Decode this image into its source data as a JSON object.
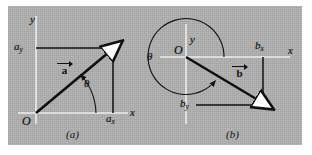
{
  "figure": {
    "background_color": "#a9a9a9",
    "border_color": "#ffffff",
    "ink_color": "#101010",
    "axis_color": "#e8e8e8",
    "arrowhead_fill": "#ffffff"
  },
  "panels": [
    {
      "id": "a",
      "caption": "(a)",
      "origin_label": "O",
      "axis_x_label": "x",
      "axis_y_label": "y",
      "angle_label": "θ",
      "vector": {
        "letter": "a",
        "overbar_arrow": true
      },
      "components": [
        {
          "name": "x-component",
          "label_letter": "a",
          "label_sub": "x"
        },
        {
          "name": "y-component",
          "label_letter": "a",
          "label_sub": "y"
        }
      ],
      "quadrant": "first",
      "angle_sense": "counterclockwise-from-positive-x"
    },
    {
      "id": "b",
      "caption": "(b)",
      "origin_label": "O",
      "axis_x_label": "x",
      "axis_y_label": "y",
      "angle_label": "θ",
      "vector": {
        "letter": "b",
        "overbar_arrow": true
      },
      "components": [
        {
          "name": "x-component",
          "label_letter": "b",
          "label_sub": "x"
        },
        {
          "name": "y-component",
          "label_letter": "b",
          "label_sub": "y"
        }
      ],
      "quadrant": "fourth",
      "angle_sense": "counterclockwise-from-positive-x-large-arc"
    }
  ]
}
